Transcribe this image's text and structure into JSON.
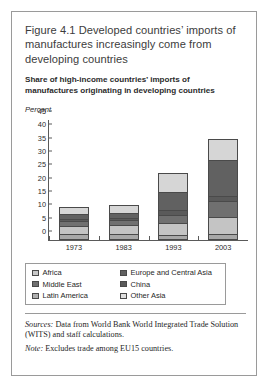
{
  "figure": {
    "title": "Figure 4.1  Developed countries’ imports of manufactures increasingly come from developing countries",
    "subtitle": "Share of high-income countries’ imports of manufactures originating in developing countries",
    "unit_label": "Percent",
    "sources_prefix": "Sources:",
    "sources_text": " Data from World Bank World Integrated Trade Solution (WITS) and staff calculations.",
    "note_prefix": "Note:",
    "note_text": " Excludes trade among EU15 countries."
  },
  "chart_data": {
    "type": "bar",
    "stacked": true,
    "title": "Share of high-income countries’ imports of manufactures originating in developing countries",
    "xlabel": "",
    "ylabel": "Percent",
    "ylim": [
      0,
      45
    ],
    "yticks": [
      0,
      5,
      10,
      15,
      20,
      25,
      30,
      35,
      40,
      45
    ],
    "grid": false,
    "legend_position": "bottom",
    "categories": [
      "1973",
      "1983",
      "1993",
      "2003"
    ],
    "series": [
      {
        "name": "Africa",
        "color": "#a8a8a8",
        "values": [
          1.5,
          1.5,
          1.0,
          1.5
        ]
      },
      {
        "name": "Latin America",
        "color": "#c4c4c4",
        "values": [
          3.5,
          3.5,
          5.0,
          6.5
        ]
      },
      {
        "name": "Middle East",
        "color": "#707070",
        "values": [
          2.0,
          2.0,
          3.0,
          6.0
        ]
      },
      {
        "name": "China",
        "color": "#5a5a5a",
        "values": [
          0.5,
          1.0,
          2.0,
          2.0
        ]
      },
      {
        "name": "Europe and Central Asia",
        "color": "#616161",
        "values": [
          2.0,
          2.0,
          7.0,
          14.0
        ]
      },
      {
        "name": "Other Asia",
        "color": "#d6d6d6",
        "values": [
          3.0,
          3.0,
          7.0,
          8.0
        ]
      }
    ],
    "totals": [
      12.5,
      13.0,
      25.0,
      38.0
    ]
  },
  "legend": {
    "rows": [
      [
        {
          "label": "Africa",
          "color": "#c9c9c9"
        },
        {
          "label": "Europe and Central Asia",
          "color": "#616161"
        }
      ],
      [
        {
          "label": "Middle East",
          "color": "#707070"
        },
        {
          "label": "China",
          "color": "#5a5a5a"
        }
      ],
      [
        {
          "label": "Latin America",
          "color": "#b0b0b0"
        },
        {
          "label": "Other Asia",
          "color": "#e0e0e0"
        }
      ]
    ]
  }
}
